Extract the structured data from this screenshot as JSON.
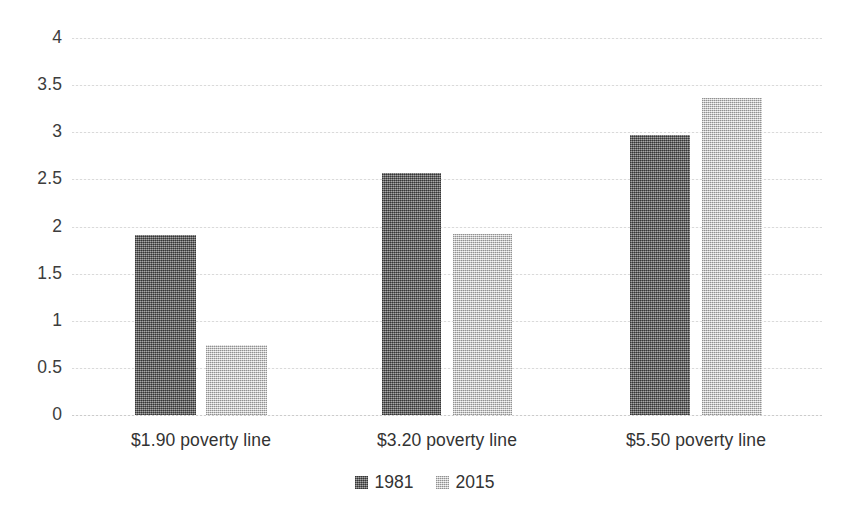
{
  "chart_data": {
    "type": "bar",
    "title": "",
    "subtitle": "",
    "xlabel": "",
    "ylabel": "",
    "categories": [
      "$1.90 poverty line",
      "$3.20 poverty line",
      "$5.50 poverty line"
    ],
    "series": [
      {
        "name": "1981",
        "color": "#6e6e6e",
        "values": [
          1.91,
          2.57,
          2.97
        ]
      },
      {
        "name": "2015",
        "color": "#d2d2d2",
        "values": [
          0.74,
          1.92,
          3.36
        ]
      }
    ],
    "ylim": [
      0,
      4
    ],
    "ytick_step": 0.5,
    "ytick_labels": [
      "4",
      "3.5",
      "3",
      "2.5",
      "2",
      "1.5",
      "1",
      "0.5",
      "0"
    ],
    "ytick_values": [
      4,
      3.5,
      3,
      2.5,
      2,
      1.5,
      1,
      0.5,
      0
    ],
    "grid": true,
    "grid_axis": "y",
    "grid_style": "dotted",
    "legend_position": "bottom-center",
    "background_color": "#ffffff",
    "axis_text_color": "#333333"
  }
}
